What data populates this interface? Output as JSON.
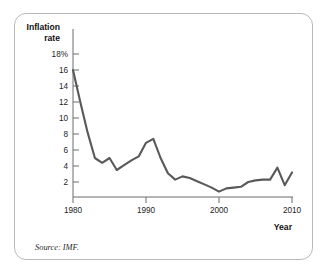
{
  "figure": {
    "source_note": "Source: IMF.",
    "border_color": "#b9b9b9",
    "background": "#ffffff"
  },
  "chart_data": {
    "type": "line",
    "title": "",
    "subtitle": "",
    "ylabel_line1": "Inflation",
    "ylabel_line2": "rate",
    "xlabel": "Year",
    "series_color": "#595959",
    "grid": false,
    "legend": "none",
    "xlim": [
      1980,
      2010
    ],
    "ylim": [
      0,
      19
    ],
    "xticks": [
      1980,
      1990,
      2000,
      2010
    ],
    "xtick_labels": [
      "1980",
      "1990",
      "2000",
      "2010"
    ],
    "yticks": [
      2,
      4,
      6,
      8,
      10,
      12,
      14,
      16,
      18
    ],
    "ytick_labels": [
      "2",
      "4",
      "6",
      "8",
      "10",
      "12",
      "14",
      "16",
      "18%"
    ],
    "x": [
      1980,
      1981,
      1982,
      1983,
      1984,
      1985,
      1986,
      1987,
      1988,
      1989,
      1990,
      1991,
      1992,
      1993,
      1994,
      1995,
      1996,
      1997,
      1998,
      1999,
      2000,
      2001,
      2002,
      2003,
      2004,
      2005,
      2006,
      2007,
      2008,
      2009,
      2010
    ],
    "values": [
      16.0,
      12.0,
      8.2,
      5.0,
      4.4,
      5.0,
      3.5,
      4.1,
      4.7,
      5.2,
      6.9,
      7.4,
      5.0,
      3.1,
      2.3,
      2.7,
      2.5,
      2.1,
      1.7,
      1.3,
      0.8,
      1.2,
      1.3,
      1.4,
      2.0,
      2.2,
      2.3,
      2.3,
      3.8,
      1.6,
      3.2
    ],
    "series": [
      {
        "name": "Inflation rate",
        "values": [
          16.0,
          12.0,
          8.2,
          5.0,
          4.4,
          5.0,
          3.5,
          4.1,
          4.7,
          5.2,
          6.9,
          7.4,
          5.0,
          3.1,
          2.3,
          2.7,
          2.5,
          2.1,
          1.7,
          1.3,
          0.8,
          1.2,
          1.3,
          1.4,
          2.0,
          2.2,
          2.3,
          2.3,
          3.8,
          1.6,
          3.2
        ]
      }
    ]
  }
}
